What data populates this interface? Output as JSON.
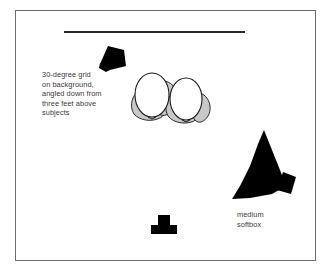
{
  "diagram": {
    "frame": {
      "border_color": "#6e6e6e"
    },
    "background": {
      "name": "background sweep",
      "color": "#2b2b2b"
    },
    "annotations": {
      "grid_note": "30-degree grid\non background,\nangled down from\nthree feet above\nsubjects",
      "softbox_label": "medium\nsoftbox"
    },
    "colors": {
      "ink": "#000000",
      "text": "#3a3a3a",
      "shoulder_gray": "#c8c8c8",
      "head_white": "#ffffff",
      "outline": "#1a1a1a",
      "frame": "#6e6e6e",
      "background_line": "#2b2b2b"
    },
    "elements": [
      {
        "name": "background-grid-light",
        "type": "light",
        "shape": "small black trapezoid / snoot pointing down-left",
        "fill": "#000000"
      },
      {
        "name": "subject-pair",
        "type": "subjects",
        "count": 2,
        "shape": "two overhead oval heads with gray shoulders",
        "head_fill": "#ffffff",
        "body_fill": "#c8c8c8"
      },
      {
        "name": "medium-softbox",
        "type": "light",
        "shape": "large black cone / triangle with rectangular head tab",
        "fill": "#000000"
      },
      {
        "name": "camera",
        "type": "camera",
        "shape": "black T-shape viewed from above",
        "fill": "#000000"
      }
    ]
  }
}
